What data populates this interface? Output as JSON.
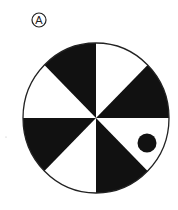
{
  "figure": {
    "label": "A",
    "wheel": {
      "sectors": 8,
      "sector_colors_clockwise_from_top": [
        "white",
        "black",
        "white",
        "black",
        "white",
        "black",
        "white",
        "black"
      ],
      "fill_dark": "#111111",
      "fill_light": "#ffffff",
      "stroke": "#222222"
    },
    "marker": {
      "shape": "dot",
      "sector_index": 2,
      "color": "#111111"
    }
  }
}
